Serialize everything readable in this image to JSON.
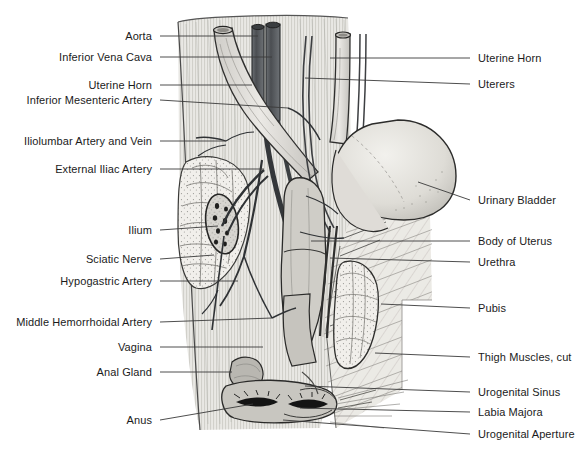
{
  "figure": {
    "colors": {
      "background": "#ffffff",
      "leader_line": "#3a3a3a",
      "label_text": "#1b1b1b",
      "tissue_light": "#e3e3e1",
      "tissue_mid": "#c9c9c6",
      "tissue_dark": "#9b9b98",
      "vessel_dark": "#55585c",
      "outline": "#2b2b2b",
      "bone_fill": "#efeeea"
    }
  },
  "labels_left": [
    {
      "id": "aorta",
      "text": "Aorta",
      "text_x": 152,
      "y": 36,
      "line_x1": 160,
      "line_x2": 258,
      "line_y2": 36
    },
    {
      "id": "inferior-vena-cava",
      "text": "Inferior Vena Cava",
      "text_x": 152,
      "y": 57,
      "line_x1": 160,
      "line_x2": 272,
      "line_y2": 57
    },
    {
      "id": "uterine-horn-left",
      "text": "Uterine Horn",
      "text_x": 152,
      "y": 85,
      "line_x1": 160,
      "line_x2": 252,
      "line_y2": 85
    },
    {
      "id": "inferior-mesenteric-artery",
      "text": "Inferior Mesenteric Artery",
      "text_x": 152,
      "y": 100,
      "line_x1": 160,
      "line_x2": 288,
      "line_y2": 108
    },
    {
      "id": "iliolumbar-artery-and-vein",
      "text": "Iliolumbar Artery and Vein",
      "text_x": 152,
      "y": 141,
      "line_x1": 160,
      "line_x2": 226,
      "line_y2": 141
    },
    {
      "id": "external-iliac-artery",
      "text": "External Iliac Artery",
      "text_x": 152,
      "y": 169,
      "line_x1": 160,
      "line_x2": 264,
      "line_y2": 169
    },
    {
      "id": "ilium",
      "text": "Ilium",
      "text_x": 152,
      "y": 230,
      "line_x1": 160,
      "line_x2": 218,
      "line_y2": 226
    },
    {
      "id": "sciatic-nerve",
      "text": "Sciatic Nerve",
      "text_x": 152,
      "y": 259,
      "line_x1": 160,
      "line_x2": 214,
      "line_y2": 255
    },
    {
      "id": "hypogastric-artery",
      "text": "Hypogastric Artery",
      "text_x": 152,
      "y": 281,
      "line_x1": 160,
      "line_x2": 238,
      "line_y2": 281
    },
    {
      "id": "middle-hemorrhoidal-artery",
      "text": "Middle Hemorrhoidal Artery",
      "text_x": 152,
      "y": 322,
      "line_x1": 160,
      "line_x2": 272,
      "line_y2": 318
    },
    {
      "id": "vagina",
      "text": "Vagina",
      "text_x": 152,
      "y": 347,
      "line_x1": 160,
      "line_x2": 263,
      "line_y2": 347
    },
    {
      "id": "anal-gland",
      "text": "Anal Gland",
      "text_x": 152,
      "y": 372,
      "line_x1": 160,
      "line_x2": 232,
      "line_y2": 372
    },
    {
      "id": "anus",
      "text": "Anus",
      "text_x": 152,
      "y": 420,
      "line_x1": 160,
      "line_x2": 253,
      "line_y2": 404
    }
  ],
  "labels_right": [
    {
      "id": "uterine-horn-right",
      "text": "Uterine Horn",
      "text_x": 478,
      "y": 58,
      "line_x1": 470,
      "line_x2": 330,
      "line_y2": 58
    },
    {
      "id": "uterers",
      "text": "Uterers",
      "text_x": 478,
      "y": 84,
      "line_x1": 470,
      "line_x2": 305,
      "line_y2": 78
    },
    {
      "id": "urinary-bladder",
      "text": "Urinary Bladder",
      "text_x": 478,
      "y": 200,
      "line_x1": 470,
      "line_x2": 418,
      "line_y2": 182
    },
    {
      "id": "body-of-uterus",
      "text": "Body of Uterus",
      "text_x": 478,
      "y": 241,
      "line_x1": 470,
      "line_x2": 311,
      "line_y2": 241
    },
    {
      "id": "urethra",
      "text": "Urethra",
      "text_x": 478,
      "y": 262,
      "line_x1": 470,
      "line_x2": 330,
      "line_y2": 258
    },
    {
      "id": "pubis",
      "text": "Pubis",
      "text_x": 478,
      "y": 308,
      "line_x1": 470,
      "line_x2": 381,
      "line_y2": 304
    },
    {
      "id": "thigh-muscles-cut",
      "text": "Thigh Muscles, cut",
      "text_x": 478,
      "y": 357,
      "line_x1": 470,
      "line_x2": 375,
      "line_y2": 353
    },
    {
      "id": "urogenital-sinus",
      "text": "Urogenital Sinus",
      "text_x": 478,
      "y": 392,
      "line_x1": 470,
      "line_x2": 305,
      "line_y2": 386
    },
    {
      "id": "labia-majora",
      "text": "Labia Majora",
      "text_x": 478,
      "y": 412,
      "line_x1": 470,
      "line_x2": 300,
      "line_y2": 408
    },
    {
      "id": "urogenital-aperture",
      "text": "Urogenital Aperture",
      "text_x": 478,
      "y": 434,
      "line_x1": 470,
      "line_x2": 283,
      "line_y2": 420
    }
  ],
  "structures": [
    {
      "id": "aorta-vessel",
      "name": "aorta"
    },
    {
      "id": "vena-cava-vessel",
      "name": "inferior-vena-cava"
    },
    {
      "id": "urinary-bladder-body",
      "name": "urinary-bladder"
    },
    {
      "id": "ilium-bone",
      "name": "ilium"
    },
    {
      "id": "sciatic-nerve-section",
      "name": "sciatic-nerve"
    },
    {
      "id": "uterus-body",
      "name": "body-of-uterus"
    },
    {
      "id": "thigh-muscle-block",
      "name": "thigh-muscles-cut"
    },
    {
      "id": "pubis-bone",
      "name": "pubis"
    },
    {
      "id": "anus-opening",
      "name": "anus"
    },
    {
      "id": "urogenital-aperture-opening",
      "name": "urogenital-aperture"
    }
  ]
}
